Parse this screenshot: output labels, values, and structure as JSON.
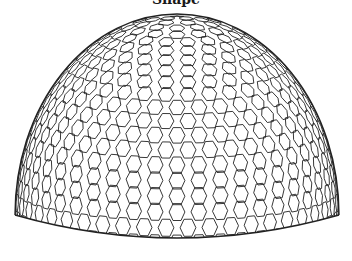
{
  "title": "Shape",
  "figure": {
    "stroke_color": "#222222",
    "background": "#ffffff",
    "dome": {
      "center_x": 177,
      "equator_y": 215,
      "radius_x": 162,
      "radius_y": 201,
      "rim_depth": 23,
      "wall_height": 0
    },
    "mesh": {
      "type": "hexagonal",
      "cell_angle_deg": 5.2,
      "stroke_width": 0.9
    }
  }
}
